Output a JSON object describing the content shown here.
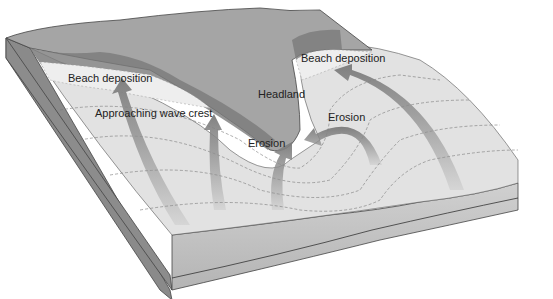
{
  "diagram": {
    "labels": {
      "beach_left": "Beach deposition",
      "beach_right": "Beach deposition",
      "headland": "Headland",
      "wave_crest": "Approaching wave crest",
      "erosion_right": "Erosion",
      "erosion_left": "Erosion"
    },
    "colors": {
      "land_top": "#9e9e9e",
      "cliff": "#7c7c7c",
      "beach": "#e6e6e6",
      "water": "#dcdcdc",
      "block_side_left": "#8a8a8a",
      "block_side_front": "#bdbdbd",
      "arrow": "#8f8f8f"
    }
  }
}
